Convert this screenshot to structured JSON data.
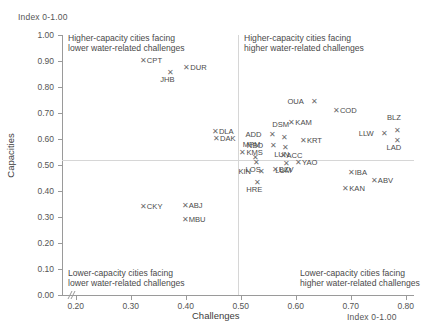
{
  "chart_data": {
    "type": "scatter",
    "title": "",
    "xlabel": "Challenges",
    "ylabel": "Capacities",
    "x_unit": "Index 0-1.00",
    "y_unit": "Index 0-1.00",
    "xlim": [
      0.175,
      0.815
    ],
    "ylim": [
      0.0,
      1.0
    ],
    "grid": false,
    "legend": "none",
    "reference_lines": {
      "x": 0.5,
      "y": 0.5
    },
    "x_ticks": [
      "0.20",
      "0.30",
      "0.40",
      "0.50",
      "0.60",
      "0.70",
      "0.80"
    ],
    "x_tick_values": [
      0.2,
      0.3,
      0.4,
      0.5,
      0.6,
      0.7,
      0.8
    ],
    "y_ticks": [
      "0.00",
      "0.10",
      "0.20",
      "0.30",
      "0.40",
      "0.50",
      "0.60",
      "0.70",
      "0.80",
      "0.90",
      "1.00"
    ],
    "y_tick_values": [
      0.0,
      0.1,
      0.2,
      0.3,
      0.4,
      0.5,
      0.6,
      0.7,
      0.8,
      0.9,
      1.0
    ],
    "annotations": [
      {
        "id": "quad-tl",
        "text": "Higher-capacity cities facing\nlower water-related challenges"
      },
      {
        "id": "quad-tr",
        "text": "Higher-capacity cities facing\nhigher water-related challenges"
      },
      {
        "id": "quad-bl",
        "text": "Lower-capacity cities facing\nlower water-related challenges"
      },
      {
        "id": "quad-br",
        "text": "Lower-capacity cities facing\nhigher water-related challenges"
      }
    ],
    "marker_glyph": "✕",
    "marker_color": "#6b6b6b",
    "points": [
      {
        "label": "CPT",
        "x": 0.322,
        "y": 0.9,
        "pos": "right"
      },
      {
        "label": "JHB",
        "x": 0.372,
        "y": 0.855,
        "pos": "below"
      },
      {
        "label": "DUR",
        "x": 0.401,
        "y": 0.872,
        "pos": "right"
      },
      {
        "label": "OUA",
        "x": 0.633,
        "y": 0.742,
        "pos": "left"
      },
      {
        "label": "COD",
        "x": 0.673,
        "y": 0.706,
        "pos": "right"
      },
      {
        "label": "KAM",
        "x": 0.592,
        "y": 0.662,
        "pos": "right"
      },
      {
        "label": "DLA",
        "x": 0.453,
        "y": 0.627,
        "pos": "right"
      },
      {
        "label": "DAK",
        "x": 0.455,
        "y": 0.6,
        "pos": "right"
      },
      {
        "label": "BLZ",
        "x": 0.784,
        "y": 0.631,
        "pos": "above"
      },
      {
        "label": "LLW",
        "x": 0.76,
        "y": 0.618,
        "pos": "left"
      },
      {
        "label": "LAD",
        "x": 0.784,
        "y": 0.592,
        "pos": "below"
      },
      {
        "label": "ADD",
        "x": 0.556,
        "y": 0.617,
        "pos": "left"
      },
      {
        "label": "DSM",
        "x": 0.578,
        "y": 0.602,
        "pos": "above"
      },
      {
        "label": "KRT",
        "x": 0.613,
        "y": 0.591,
        "pos": "right"
      },
      {
        "label": "NBO",
        "x": 0.559,
        "y": 0.575,
        "pos": "left"
      },
      {
        "label": "LUN",
        "x": 0.58,
        "y": 0.566,
        "pos": "below"
      },
      {
        "label": "KMS",
        "x": 0.503,
        "y": 0.548,
        "pos": "right"
      },
      {
        "label": "MPM",
        "x": 0.525,
        "y": 0.528,
        "pos": "above"
      },
      {
        "label": "ACC",
        "x": 0.576,
        "y": 0.535,
        "pos": "right"
      },
      {
        "label": "LOS",
        "x": 0.528,
        "y": 0.507,
        "pos": "below"
      },
      {
        "label": "LUM",
        "x": 0.583,
        "y": 0.505,
        "pos": "below"
      },
      {
        "label": "YAO",
        "x": 0.604,
        "y": 0.508,
        "pos": "right"
      },
      {
        "label": "KIN",
        "x": 0.537,
        "y": 0.474,
        "pos": "left"
      },
      {
        "label": "BZV",
        "x": 0.562,
        "y": 0.482,
        "pos": "right"
      },
      {
        "label": "HRE",
        "x": 0.53,
        "y": 0.43,
        "pos": "below"
      },
      {
        "label": "IBA",
        "x": 0.7,
        "y": 0.469,
        "pos": "right"
      },
      {
        "label": "ABV",
        "x": 0.742,
        "y": 0.44,
        "pos": "right"
      },
      {
        "label": "KAN",
        "x": 0.69,
        "y": 0.409,
        "pos": "right"
      },
      {
        "label": "CKY",
        "x": 0.322,
        "y": 0.34,
        "pos": "right"
      },
      {
        "label": "ABJ",
        "x": 0.398,
        "y": 0.341,
        "pos": "right"
      },
      {
        "label": "MBU",
        "x": 0.398,
        "y": 0.288,
        "pos": "right"
      }
    ]
  }
}
